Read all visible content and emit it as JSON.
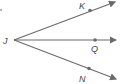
{
  "diagram": {
    "type": "angle-rays",
    "vertex": {
      "label": "J",
      "x": 14,
      "y": 40
    },
    "rays": [
      {
        "label": "K",
        "point": {
          "x": 90,
          "y": 10
        },
        "end": {
          "x": 115,
          "y": 1
        },
        "label_pos": {
          "x": 79,
          "y": 9
        }
      },
      {
        "label": "Q",
        "point": {
          "x": 95,
          "y": 40
        },
        "end": {
          "x": 117,
          "y": 40
        },
        "label_pos": {
          "x": 91,
          "y": 51
        }
      },
      {
        "label": "N",
        "point": {
          "x": 89,
          "y": 69
        },
        "end": {
          "x": 117,
          "y": 80
        },
        "label_pos": {
          "x": 79,
          "y": 81
        }
      }
    ],
    "colors": {
      "line": "#6b6b6b",
      "label": "#444444"
    }
  }
}
